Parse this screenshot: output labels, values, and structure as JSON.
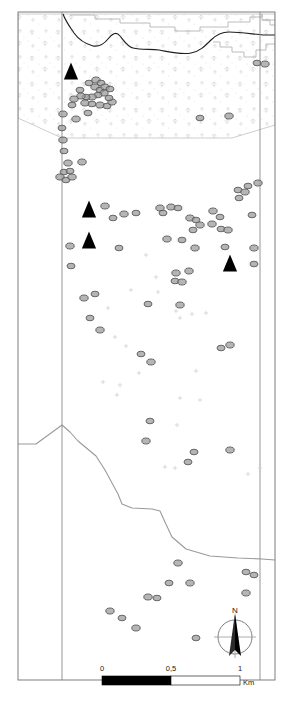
{
  "map": {
    "title": "Archaeological site distribution map",
    "frame": {
      "x": 18,
      "y": 12,
      "width": 257,
      "height": 668,
      "stroke": "#6f6f6f"
    },
    "colors": {
      "frame_line": "#6f6f6f",
      "grid_line": "#8a8a8a",
      "dark_boundary": "#1f1f1f",
      "light_boundary": "#b4b4b4",
      "river_line": "#9a9a9a",
      "circle_fill": "#9c9c9c",
      "circle_stroke": "#5a5a5a",
      "triangle_fill": "#000000",
      "vegetation_tint": "#d9d9d9",
      "faint_cross": "#cfcfcf",
      "scalebar_fill": "#000000",
      "text": "#1a1a1a"
    },
    "grid_lines": [
      {
        "name": "west-grid-line",
        "x": 62
      },
      {
        "name": "east-grid-line",
        "x": 260
      }
    ],
    "vegetation_area": {
      "name": "forest-vegetation-polygon",
      "label": "wooded / vegetated zone",
      "outline": "18,14 275,14 275,125 232,138 62,138 18,118"
    },
    "dark_boundary_path": "M 63,14 C 66,22 70,27 74,33 C 79,40 86,44 93,46 C 99,47 104,44 108,39 C 112,34 116,31 120,36 C 124,41 128,47 133,48 C 141,50 150,49 159,50 C 170,52 181,55 191,53 C 199,52 205,46 211,40 C 216,35 222,32 229,32 C 240,32 252,34 263,35 L 275,35",
    "step_boundary_paths": [
      "M 70,15 L 95,15 L 95,19 L 120,19 L 120,23 L 150,23 L 150,27 L 175,27 L 175,31 L 200,31 L 200,27 L 228,27 L 228,22 L 250,22 L 250,17 L 262,17 L 262,14",
      "M 262,14 L 262,20 L 270,20 L 270,25 L 275,25",
      "M 213,42 L 220,42 L 220,47 L 232,47 L 232,52 L 244,52 L 244,57 L 256,57 L 256,50 L 266,50 L 266,44 L 275,44",
      "M 262,20 L 275,20"
    ],
    "river_path": "M 18,444 L 36,444 L 62,425 L 70,432 L 78,441 L 96,456 L 105,470 L 112,483 L 118,494 L 122,504 L 132,508 L 152,509 L 160,511 L 164,520 L 172,537 L 186,549 L 210,556 L 238,558 L 262,559 L 275,560",
    "triangles": [
      {
        "name": "site-triangle-1",
        "cx": 71,
        "cy": 73,
        "size": 11
      },
      {
        "name": "site-triangle-2",
        "cx": 89,
        "cy": 211,
        "size": 11
      },
      {
        "name": "site-triangle-3",
        "cx": 89,
        "cy": 242,
        "size": 11
      },
      {
        "name": "site-triangle-4",
        "cx": 230,
        "cy": 265,
        "size": 11
      }
    ],
    "circles": [
      {
        "cx": 89,
        "cy": 83,
        "rx": 4.0,
        "ry": 2.8
      },
      {
        "cx": 96,
        "cy": 80,
        "rx": 4.2,
        "ry": 3.0
      },
      {
        "cx": 101,
        "cy": 83,
        "rx": 4.0,
        "ry": 2.8
      },
      {
        "cx": 95,
        "cy": 87,
        "rx": 4.2,
        "ry": 3.0
      },
      {
        "cx": 100,
        "cy": 90,
        "rx": 4.0,
        "ry": 2.8
      },
      {
        "cx": 105,
        "cy": 87,
        "rx": 4.2,
        "ry": 3.0
      },
      {
        "cx": 110,
        "cy": 89,
        "rx": 4.0,
        "ry": 2.8
      },
      {
        "cx": 104,
        "cy": 93,
        "rx": 4.2,
        "ry": 3.0
      },
      {
        "cx": 98,
        "cy": 95,
        "rx": 4.0,
        "ry": 2.8
      },
      {
        "cx": 92,
        "cy": 97,
        "rx": 4.2,
        "ry": 3.0
      },
      {
        "cx": 86,
        "cy": 97,
        "rx": 4.0,
        "ry": 2.8
      },
      {
        "cx": 81,
        "cy": 96,
        "rx": 4.2,
        "ry": 3.0
      },
      {
        "cx": 80,
        "cy": 90,
        "rx": 4.0,
        "ry": 2.8
      },
      {
        "cx": 74,
        "cy": 99,
        "rx": 4.2,
        "ry": 3.0
      },
      {
        "cx": 72,
        "cy": 105,
        "rx": 4.0,
        "ry": 2.8
      },
      {
        "cx": 85,
        "cy": 103,
        "rx": 4.2,
        "ry": 3.0
      },
      {
        "cx": 92,
        "cy": 104,
        "rx": 4.0,
        "ry": 2.8
      },
      {
        "cx": 100,
        "cy": 105,
        "rx": 4.2,
        "ry": 3.0
      },
      {
        "cx": 107,
        "cy": 106,
        "rx": 4.0,
        "ry": 2.8
      },
      {
        "cx": 112,
        "cy": 102,
        "rx": 4.2,
        "ry": 3.0
      },
      {
        "cx": 109,
        "cy": 98,
        "rx": 4.0,
        "ry": 2.8
      },
      {
        "cx": 63,
        "cy": 114,
        "rx": 4.2,
        "ry": 3.0
      },
      {
        "cx": 88,
        "cy": 113,
        "rx": 4.0,
        "ry": 2.8
      },
      {
        "cx": 76,
        "cy": 119,
        "rx": 4.2,
        "ry": 3.0
      },
      {
        "cx": 62,
        "cy": 128,
        "rx": 4.0,
        "ry": 2.8
      },
      {
        "cx": 63,
        "cy": 140,
        "rx": 4.2,
        "ry": 3.0
      },
      {
        "cx": 64,
        "cy": 151,
        "rx": 4.0,
        "ry": 2.8
      },
      {
        "cx": 68,
        "cy": 163,
        "rx": 4.2,
        "ry": 3.0
      },
      {
        "cx": 64,
        "cy": 172,
        "rx": 4.0,
        "ry": 2.8
      },
      {
        "cx": 60,
        "cy": 177,
        "rx": 4.2,
        "ry": 3.0
      },
      {
        "cx": 66,
        "cy": 180,
        "rx": 4.0,
        "ry": 2.8
      },
      {
        "cx": 72,
        "cy": 177,
        "rx": 4.2,
        "ry": 3.0
      },
      {
        "cx": 70,
        "cy": 171,
        "rx": 4.0,
        "ry": 2.8
      },
      {
        "cx": 82,
        "cy": 162,
        "rx": 4.2,
        "ry": 3.0
      },
      {
        "cx": 200,
        "cy": 118,
        "rx": 4.0,
        "ry": 2.8
      },
      {
        "cx": 229,
        "cy": 116,
        "rx": 4.2,
        "ry": 3.0
      },
      {
        "cx": 257,
        "cy": 63,
        "rx": 4.0,
        "ry": 2.8
      },
      {
        "cx": 265,
        "cy": 64,
        "rx": 4.2,
        "ry": 3.0
      },
      {
        "cx": 248,
        "cy": 186,
        "rx": 4.0,
        "ry": 2.8
      },
      {
        "cx": 258,
        "cy": 183,
        "rx": 4.2,
        "ry": 3.0
      },
      {
        "cx": 238,
        "cy": 190,
        "rx": 4.0,
        "ry": 2.8
      },
      {
        "cx": 245,
        "cy": 192,
        "rx": 4.2,
        "ry": 3.0
      },
      {
        "cx": 239,
        "cy": 198,
        "rx": 4.0,
        "ry": 2.8
      },
      {
        "cx": 105,
        "cy": 206,
        "rx": 4.2,
        "ry": 3.0
      },
      {
        "cx": 113,
        "cy": 218,
        "rx": 4.0,
        "ry": 2.8
      },
      {
        "cx": 124,
        "cy": 214,
        "rx": 4.2,
        "ry": 3.0
      },
      {
        "cx": 136,
        "cy": 213,
        "rx": 4.0,
        "ry": 2.8
      },
      {
        "cx": 160,
        "cy": 208,
        "rx": 4.2,
        "ry": 3.0
      },
      {
        "cx": 163,
        "cy": 213,
        "rx": 4.0,
        "ry": 2.8
      },
      {
        "cx": 171,
        "cy": 207,
        "rx": 4.2,
        "ry": 3.0
      },
      {
        "cx": 178,
        "cy": 208,
        "rx": 4.0,
        "ry": 2.8
      },
      {
        "cx": 190,
        "cy": 218,
        "rx": 4.2,
        "ry": 3.0
      },
      {
        "cx": 196,
        "cy": 220,
        "rx": 4.0,
        "ry": 2.8
      },
      {
        "cx": 200,
        "cy": 225,
        "rx": 4.2,
        "ry": 3.0
      },
      {
        "cx": 193,
        "cy": 230,
        "rx": 4.0,
        "ry": 2.8
      },
      {
        "cx": 213,
        "cy": 211,
        "rx": 4.2,
        "ry": 3.0
      },
      {
        "cx": 220,
        "cy": 217,
        "rx": 4.0,
        "ry": 2.8
      },
      {
        "cx": 212,
        "cy": 224,
        "rx": 4.2,
        "ry": 3.0
      },
      {
        "cx": 221,
        "cy": 229,
        "rx": 4.0,
        "ry": 2.8
      },
      {
        "cx": 228,
        "cy": 230,
        "rx": 4.2,
        "ry": 3.0
      },
      {
        "cx": 252,
        "cy": 215,
        "rx": 4.0,
        "ry": 2.8
      },
      {
        "cx": 254,
        "cy": 248,
        "rx": 4.2,
        "ry": 3.0
      },
      {
        "cx": 225,
        "cy": 247,
        "rx": 4.0,
        "ry": 2.8
      },
      {
        "cx": 195,
        "cy": 248,
        "rx": 4.2,
        "ry": 3.0
      },
      {
        "cx": 182,
        "cy": 240,
        "rx": 4.0,
        "ry": 2.8
      },
      {
        "cx": 167,
        "cy": 239,
        "rx": 4.2,
        "ry": 3.0
      },
      {
        "cx": 119,
        "cy": 248,
        "rx": 4.0,
        "ry": 2.8
      },
      {
        "cx": 70,
        "cy": 246,
        "rx": 4.2,
        "ry": 3.0
      },
      {
        "cx": 71,
        "cy": 266,
        "rx": 4.0,
        "ry": 2.8
      },
      {
        "cx": 189,
        "cy": 271,
        "rx": 4.2,
        "ry": 3.0
      },
      {
        "cx": 254,
        "cy": 264,
        "rx": 4.0,
        "ry": 2.8
      },
      {
        "cx": 176,
        "cy": 273,
        "rx": 4.2,
        "ry": 3.0
      },
      {
        "cx": 175,
        "cy": 281,
        "rx": 4.0,
        "ry": 2.8
      },
      {
        "cx": 182,
        "cy": 282,
        "rx": 4.2,
        "ry": 3.0
      },
      {
        "cx": 95,
        "cy": 294,
        "rx": 4.0,
        "ry": 2.8
      },
      {
        "cx": 84,
        "cy": 298,
        "rx": 4.2,
        "ry": 3.0
      },
      {
        "cx": 90,
        "cy": 318,
        "rx": 4.0,
        "ry": 2.8
      },
      {
        "cx": 100,
        "cy": 330,
        "rx": 4.2,
        "ry": 3.0
      },
      {
        "cx": 148,
        "cy": 304,
        "rx": 4.0,
        "ry": 2.8
      },
      {
        "cx": 180,
        "cy": 305,
        "rx": 4.2,
        "ry": 3.0
      },
      {
        "cx": 141,
        "cy": 354,
        "rx": 4.0,
        "ry": 2.8
      },
      {
        "cx": 151,
        "cy": 362,
        "rx": 4.2,
        "ry": 3.0
      },
      {
        "cx": 221,
        "cy": 348,
        "rx": 4.0,
        "ry": 2.8
      },
      {
        "cx": 230,
        "cy": 345,
        "rx": 4.2,
        "ry": 3.0
      },
      {
        "cx": 150,
        "cy": 421,
        "rx": 4.0,
        "ry": 2.8
      },
      {
        "cx": 146,
        "cy": 441,
        "rx": 4.2,
        "ry": 3.0
      },
      {
        "cx": 194,
        "cy": 452,
        "rx": 4.0,
        "ry": 2.8
      },
      {
        "cx": 230,
        "cy": 450,
        "rx": 4.2,
        "ry": 3.0
      },
      {
        "cx": 188,
        "cy": 462,
        "rx": 4.0,
        "ry": 2.8
      },
      {
        "cx": 178,
        "cy": 563,
        "rx": 4.2,
        "ry": 3.0
      },
      {
        "cx": 246,
        "cy": 572,
        "rx": 4.0,
        "ry": 2.8
      },
      {
        "cx": 190,
        "cy": 583,
        "rx": 4.2,
        "ry": 3.0
      },
      {
        "cx": 157,
        "cy": 598,
        "rx": 4.0,
        "ry": 2.8
      },
      {
        "cx": 148,
        "cy": 597,
        "rx": 4.2,
        "ry": 3.0
      },
      {
        "cx": 169,
        "cy": 583,
        "rx": 4.0,
        "ry": 2.8
      },
      {
        "cx": 246,
        "cy": 593,
        "rx": 4.2,
        "ry": 3.0
      },
      {
        "cx": 254,
        "cy": 575,
        "rx": 4.0,
        "ry": 2.8
      },
      {
        "cx": 110,
        "cy": 611,
        "rx": 4.2,
        "ry": 3.0
      },
      {
        "cx": 122,
        "cy": 618,
        "rx": 4.0,
        "ry": 2.8
      },
      {
        "cx": 136,
        "cy": 628,
        "rx": 4.2,
        "ry": 3.0
      },
      {
        "cx": 196,
        "cy": 638,
        "rx": 4.0,
        "ry": 2.8
      }
    ],
    "faint_crosses": [
      {
        "cx": 146,
        "cy": 255
      },
      {
        "cx": 156,
        "cy": 277
      },
      {
        "cx": 131,
        "cy": 290
      },
      {
        "cx": 158,
        "cy": 292
      },
      {
        "cx": 108,
        "cy": 308
      },
      {
        "cx": 176,
        "cy": 311
      },
      {
        "cx": 180,
        "cy": 318
      },
      {
        "cx": 192,
        "cy": 314
      },
      {
        "cx": 206,
        "cy": 313
      },
      {
        "cx": 115,
        "cy": 337
      },
      {
        "cx": 126,
        "cy": 346
      },
      {
        "cx": 139,
        "cy": 373
      },
      {
        "cx": 196,
        "cy": 371
      },
      {
        "cx": 120,
        "cy": 385
      },
      {
        "cx": 103,
        "cy": 382
      },
      {
        "cx": 117,
        "cy": 395
      },
      {
        "cx": 180,
        "cy": 398
      },
      {
        "cx": 200,
        "cy": 400
      },
      {
        "cx": 177,
        "cy": 425
      },
      {
        "cx": 165,
        "cy": 467
      },
      {
        "cx": 175,
        "cy": 468
      },
      {
        "cx": 260,
        "cy": 468
      },
      {
        "cx": 248,
        "cy": 474
      },
      {
        "cx": 111,
        "cy": 680
      }
    ],
    "scalebar": {
      "name": "scale-bar",
      "x": 102,
      "y": 676,
      "width": 138,
      "height": 9,
      "ticks": [
        {
          "label": "0",
          "fraction": 0
        },
        {
          "label": "0,5",
          "fraction": 0.5
        },
        {
          "label": "1",
          "fraction": 1
        }
      ],
      "unit": "Km"
    },
    "north_arrow": {
      "name": "north-arrow",
      "cx": 235,
      "cy": 637,
      "radius": 17,
      "label": "N"
    }
  }
}
